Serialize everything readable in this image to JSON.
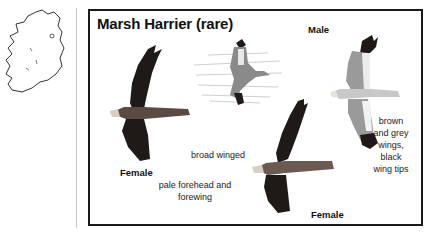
{
  "sidebar": {
    "map_icon": "ireland-map-outline"
  },
  "card": {
    "title": "Marsh Harrier (rare)",
    "labels": {
      "male": "Male",
      "female_left": "Female",
      "female_center": "Female",
      "broad_winged": "broad winged",
      "pale_forehead_line1": "pale forehead and",
      "pale_forehead_line2": "forewing",
      "male_wings_1": "brown",
      "male_wings_2": "and grey",
      "male_wings_3": "wings,",
      "male_wings_4": "black",
      "male_wings_5": "wing tips"
    },
    "illustrations": [
      {
        "name": "female-flying-left",
        "plumage": "dark brown"
      },
      {
        "name": "harrier-over-reeds",
        "plumage": "grey and brown"
      },
      {
        "name": "male-flying",
        "plumage": "brown, grey, black tips"
      },
      {
        "name": "female-flying-center",
        "plumage": "dark brown, pale head"
      }
    ]
  },
  "colors": {
    "frame": "#1a1a1a",
    "divider": "#c8c8c8",
    "dark_plumage": "#1f1a18",
    "grey_plumage": "#9a9a9a"
  }
}
